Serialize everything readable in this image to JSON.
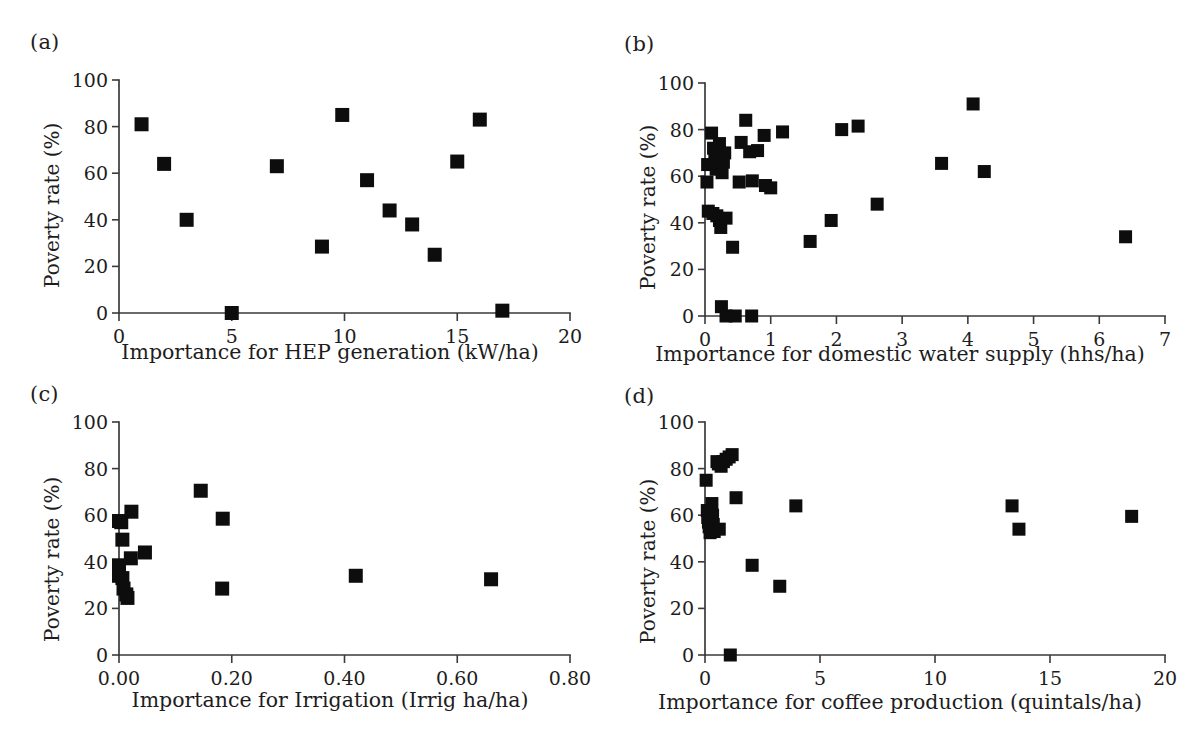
{
  "figure": {
    "background": "#ffffff",
    "marker_color": "#0d0d0d",
    "axis_color": "#3a3a3a",
    "shared_ylabel": "Poverty rate (%)"
  },
  "panels": [
    {
      "key": "a",
      "label": "(a)",
      "chart_data": {
        "type": "scatter",
        "title": "",
        "xlabel": "Importance for HEP generation (kW/ha)",
        "ylabel": "Poverty rate (%)",
        "xlim": [
          0,
          20
        ],
        "ylim": [
          0,
          100
        ],
        "xticks": [
          0,
          5,
          10,
          15,
          20
        ],
        "xticklabels": [
          "0",
          "5",
          "10",
          "15",
          "20"
        ],
        "yticks": [
          0,
          20,
          40,
          60,
          80,
          100
        ],
        "yticklabels": [
          "0",
          "20",
          "40",
          "60",
          "80",
          "100"
        ],
        "grid": false,
        "legend": null,
        "marker": "square",
        "points": [
          {
            "x": 1.0,
            "y": 81
          },
          {
            "x": 2.0,
            "y": 64
          },
          {
            "x": 3.0,
            "y": 40
          },
          {
            "x": 5.0,
            "y": 0
          },
          {
            "x": 7.0,
            "y": 63
          },
          {
            "x": 9.0,
            "y": 28.5
          },
          {
            "x": 9.9,
            "y": 85
          },
          {
            "x": 11.0,
            "y": 57
          },
          {
            "x": 12.0,
            "y": 44
          },
          {
            "x": 13.0,
            "y": 38
          },
          {
            "x": 14.0,
            "y": 25
          },
          {
            "x": 15.0,
            "y": 65
          },
          {
            "x": 16.0,
            "y": 83
          },
          {
            "x": 17.0,
            "y": 1
          }
        ]
      }
    },
    {
      "key": "b",
      "label": "(b)",
      "chart_data": {
        "type": "scatter",
        "title": "",
        "xlabel": "Importance for domestic water supply (hhs/ha)",
        "ylabel": "Poverty rate (%)",
        "xlim": [
          0,
          7
        ],
        "ylim": [
          0,
          100
        ],
        "xticks": [
          0,
          1,
          2,
          3,
          4,
          5,
          6,
          7
        ],
        "xticklabels": [
          "0",
          "1",
          "2",
          "3",
          "4",
          "5",
          "6",
          "7"
        ],
        "yticks": [
          0,
          20,
          40,
          60,
          80,
          100
        ],
        "yticklabels": [
          "0",
          "20",
          "40",
          "60",
          "80",
          "100"
        ],
        "grid": false,
        "legend": null,
        "marker": "square",
        "points": [
          {
            "x": 0.04,
            "y": 65
          },
          {
            "x": 0.03,
            "y": 57.5
          },
          {
            "x": 0.05,
            "y": 45
          },
          {
            "x": 0.12,
            "y": 44
          },
          {
            "x": 0.1,
            "y": 78.5
          },
          {
            "x": 0.13,
            "y": 72
          },
          {
            "x": 0.15,
            "y": 68
          },
          {
            "x": 0.17,
            "y": 63
          },
          {
            "x": 0.2,
            "y": 70
          },
          {
            "x": 0.22,
            "y": 74
          },
          {
            "x": 0.18,
            "y": 43
          },
          {
            "x": 0.22,
            "y": 41
          },
          {
            "x": 0.24,
            "y": 38
          },
          {
            "x": 0.26,
            "y": 61.5
          },
          {
            "x": 0.3,
            "y": 70
          },
          {
            "x": 0.28,
            "y": 66
          },
          {
            "x": 0.32,
            "y": 42
          },
          {
            "x": 0.25,
            "y": 4
          },
          {
            "x": 0.32,
            "y": 0
          },
          {
            "x": 0.46,
            "y": 0
          },
          {
            "x": 0.71,
            "y": 0
          },
          {
            "x": 0.42,
            "y": 29.5
          },
          {
            "x": 0.52,
            "y": 57.5
          },
          {
            "x": 0.55,
            "y": 74.5
          },
          {
            "x": 0.62,
            "y": 84
          },
          {
            "x": 0.68,
            "y": 70.5
          },
          {
            "x": 0.72,
            "y": 58
          },
          {
            "x": 0.8,
            "y": 71
          },
          {
            "x": 0.9,
            "y": 77.5
          },
          {
            "x": 0.92,
            "y": 56
          },
          {
            "x": 1.0,
            "y": 55
          },
          {
            "x": 1.18,
            "y": 79
          },
          {
            "x": 1.6,
            "y": 32
          },
          {
            "x": 1.92,
            "y": 41
          },
          {
            "x": 2.08,
            "y": 80
          },
          {
            "x": 2.33,
            "y": 81.5
          },
          {
            "x": 2.62,
            "y": 48
          },
          {
            "x": 3.6,
            "y": 65.5
          },
          {
            "x": 4.08,
            "y": 91
          },
          {
            "x": 4.25,
            "y": 62
          },
          {
            "x": 6.4,
            "y": 34
          }
        ]
      }
    },
    {
      "key": "c",
      "label": "(c)",
      "chart_data": {
        "type": "scatter",
        "title": "",
        "xlabel": "Importance for Irrigation (Irrig ha/ha)",
        "ylabel": "Poverty rate (%)",
        "xlim": [
          0,
          0.8
        ],
        "ylim": [
          0,
          100
        ],
        "xticks": [
          0.0,
          0.2,
          0.4,
          0.6,
          0.8
        ],
        "xticklabels": [
          "0.00",
          "0.20",
          "0.40",
          "0.60",
          "0.80"
        ],
        "yticks": [
          0,
          20,
          40,
          60,
          80,
          100
        ],
        "yticklabels": [
          "0",
          "20",
          "40",
          "60",
          "80",
          "100"
        ],
        "grid": false,
        "legend": null,
        "marker": "square",
        "points": [
          {
            "x": 0.0,
            "y": 57.5
          },
          {
            "x": 0.004,
            "y": 57
          },
          {
            "x": 0.006,
            "y": 49.5
          },
          {
            "x": 0.0,
            "y": 38.5
          },
          {
            "x": 0.0,
            "y": 34
          },
          {
            "x": 0.006,
            "y": 33
          },
          {
            "x": 0.008,
            "y": 28.5
          },
          {
            "x": 0.013,
            "y": 26
          },
          {
            "x": 0.015,
            "y": 24.5
          },
          {
            "x": 0.022,
            "y": 61.5
          },
          {
            "x": 0.021,
            "y": 41.5
          },
          {
            "x": 0.046,
            "y": 44
          },
          {
            "x": 0.145,
            "y": 70.5
          },
          {
            "x": 0.184,
            "y": 58.5
          },
          {
            "x": 0.183,
            "y": 28.5
          },
          {
            "x": 0.42,
            "y": 34
          },
          {
            "x": 0.66,
            "y": 32.5
          }
        ]
      }
    },
    {
      "key": "d",
      "label": "(d)",
      "chart_data": {
        "type": "scatter",
        "title": "",
        "xlabel": "Importance for coffee production (quintals/ha)",
        "ylabel": "Poverty rate (%)",
        "xlim": [
          0,
          20
        ],
        "ylim": [
          0,
          100
        ],
        "xticks": [
          0,
          5,
          10,
          15,
          20
        ],
        "xticklabels": [
          "0",
          "5",
          "10",
          "15",
          "20"
        ],
        "yticks": [
          0,
          20,
          40,
          60,
          80,
          100
        ],
        "yticklabels": [
          "0",
          "20",
          "40",
          "60",
          "80",
          "100"
        ],
        "grid": false,
        "legend": null,
        "marker": "square",
        "points": [
          {
            "x": 0.05,
            "y": 75
          },
          {
            "x": 0.1,
            "y": 62
          },
          {
            "x": 0.12,
            "y": 59
          },
          {
            "x": 0.15,
            "y": 57
          },
          {
            "x": 0.18,
            "y": 55
          },
          {
            "x": 0.22,
            "y": 52.5
          },
          {
            "x": 0.3,
            "y": 65
          },
          {
            "x": 0.33,
            "y": 60
          },
          {
            "x": 0.36,
            "y": 56
          },
          {
            "x": 0.4,
            "y": 53
          },
          {
            "x": 0.52,
            "y": 83
          },
          {
            "x": 0.58,
            "y": 82
          },
          {
            "x": 0.62,
            "y": 54
          },
          {
            "x": 0.7,
            "y": 81
          },
          {
            "x": 0.8,
            "y": 83
          },
          {
            "x": 0.92,
            "y": 84
          },
          {
            "x": 1.05,
            "y": 85
          },
          {
            "x": 1.18,
            "y": 86
          },
          {
            "x": 1.1,
            "y": 0
          },
          {
            "x": 1.35,
            "y": 67.5
          },
          {
            "x": 2.05,
            "y": 38.5
          },
          {
            "x": 3.25,
            "y": 29.5
          },
          {
            "x": 3.95,
            "y": 64
          },
          {
            "x": 13.35,
            "y": 64
          },
          {
            "x": 13.65,
            "y": 54
          },
          {
            "x": 18.55,
            "y": 59.5
          }
        ]
      }
    }
  ]
}
